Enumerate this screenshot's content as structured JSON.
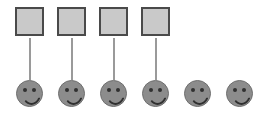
{
  "diagram": {
    "canvas": {
      "width": 264,
      "height": 117,
      "background": "#ffffff"
    },
    "colors": {
      "square_fill": "#c9c9c9",
      "square_border": "#4a4a4a",
      "connector": "#9a9a9a",
      "face_fill": "#8c8c8c",
      "face_border": "#6e6e6e",
      "feature": "#303030"
    },
    "counts": {
      "squares": 4,
      "faces": 6,
      "connectors": 4,
      "unmatched_faces": 2
    },
    "squares": [
      {
        "id": "square-1",
        "label": "",
        "x": 15,
        "y": 7,
        "size": 29
      },
      {
        "id": "square-2",
        "label": "",
        "x": 57,
        "y": 7,
        "size": 29
      },
      {
        "id": "square-3",
        "label": "",
        "x": 99,
        "y": 7,
        "size": 29
      },
      {
        "id": "square-4",
        "label": "",
        "x": 141,
        "y": 7,
        "size": 29
      }
    ],
    "connectors": [
      {
        "id": "connector-1",
        "from": "square-1",
        "to": "face-1",
        "x": 29,
        "y": 38,
        "width": 2,
        "height": 42
      },
      {
        "id": "connector-2",
        "from": "square-2",
        "to": "face-2",
        "x": 71,
        "y": 38,
        "width": 2,
        "height": 42
      },
      {
        "id": "connector-3",
        "from": "square-3",
        "to": "face-3",
        "x": 113,
        "y": 38,
        "width": 2,
        "height": 42
      },
      {
        "id": "connector-4",
        "from": "square-4",
        "to": "face-4",
        "x": 155,
        "y": 38,
        "width": 2,
        "height": 42
      }
    ],
    "faces": [
      {
        "id": "face-1",
        "label": "",
        "x": 16,
        "y": 80,
        "size": 27,
        "matched": true
      },
      {
        "id": "face-2",
        "label": "",
        "x": 58,
        "y": 80,
        "size": 27,
        "matched": true
      },
      {
        "id": "face-3",
        "label": "",
        "x": 100,
        "y": 80,
        "size": 27,
        "matched": true
      },
      {
        "id": "face-4",
        "label": "",
        "x": 142,
        "y": 80,
        "size": 27,
        "matched": true
      },
      {
        "id": "face-5",
        "label": "",
        "x": 184,
        "y": 80,
        "size": 27,
        "matched": false
      },
      {
        "id": "face-6",
        "label": "",
        "x": 226,
        "y": 80,
        "size": 27,
        "matched": false
      }
    ]
  }
}
